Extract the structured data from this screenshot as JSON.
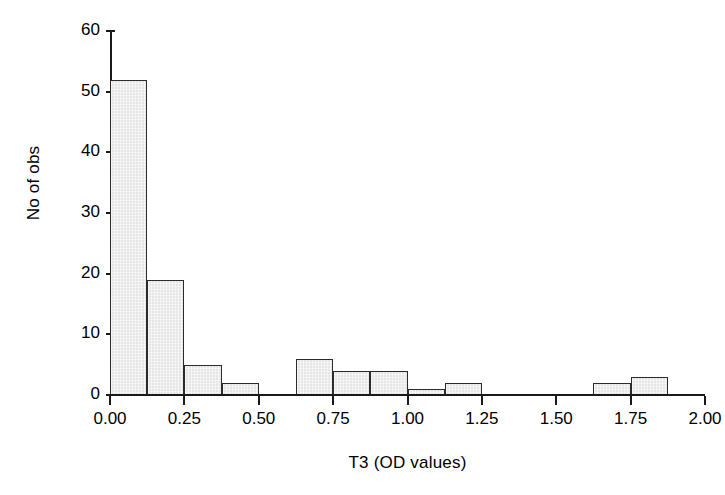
{
  "chart_data": {
    "type": "bar",
    "title": "",
    "subtitle": "",
    "xlabel": "T3 (OD values)",
    "ylabel": "No of obs",
    "xlim": [
      0.0,
      2.0
    ],
    "ylim": [
      0,
      60
    ],
    "grid": false,
    "legend": "none",
    "bin_width": 0.125,
    "bin_edges": [
      0.0,
      0.125,
      0.25,
      0.375,
      0.5,
      0.625,
      0.75,
      0.875,
      1.0,
      1.125,
      1.25,
      1.375,
      1.5,
      1.625,
      1.75,
      1.875,
      2.0
    ],
    "categories": [
      "0.000-0.125",
      "0.125-0.250",
      "0.250-0.375",
      "0.375-0.500",
      "0.500-0.625",
      "0.625-0.750",
      "0.750-0.875",
      "0.875-1.000",
      "1.000-1.125",
      "1.125-1.250",
      "1.250-1.375",
      "1.375-1.500",
      "1.500-1.625",
      "1.625-1.750",
      "1.750-1.875",
      "1.875-2.000"
    ],
    "values": [
      52,
      19,
      5,
      2,
      0,
      6,
      4,
      4,
      1,
      2,
      0,
      0,
      0,
      2,
      3,
      0
    ],
    "x_ticks": [
      "0.00",
      "0.25",
      "0.50",
      "0.75",
      "1.00",
      "1.25",
      "1.50",
      "1.75",
      "2.00"
    ],
    "x_tick_values": [
      0.0,
      0.25,
      0.5,
      0.75,
      1.0,
      1.25,
      1.5,
      1.75,
      2.0
    ],
    "y_ticks": [
      "0",
      "10",
      "20",
      "30",
      "40",
      "50",
      "60"
    ],
    "y_tick_values": [
      0,
      10,
      20,
      30,
      40,
      50,
      60
    ],
    "colors": {
      "bar_fill": "#e6e6e6",
      "bar_edge": "#2b2b2b",
      "axis": "#1a1a1a",
      "text": "#000000",
      "background": "#ffffff"
    }
  }
}
